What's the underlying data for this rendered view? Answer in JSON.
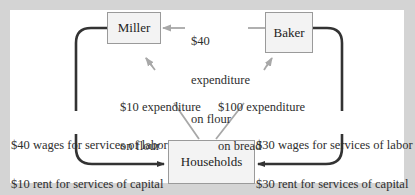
{
  "diagram": {
    "type": "circular-flow",
    "nodes": {
      "miller": {
        "label": "Miller"
      },
      "baker": {
        "label": "Baker"
      },
      "households": {
        "label": "Households"
      }
    },
    "flows": {
      "baker_to_miller": {
        "line1": "$40",
        "line2": "expenditure",
        "line3": "on flour"
      },
      "households_to_miller": {
        "line1": "$10 expenditure",
        "line2": "on flour"
      },
      "households_to_baker": {
        "line1": "$100 expenditure",
        "line2": "on bread"
      },
      "miller_to_households": {
        "line1": "$40 wages for services of labor",
        "line2": "$10 rent for services of capital"
      },
      "baker_to_households": {
        "line1": "$30 wages for services of labor",
        "line2": "$30 rent for services of capital"
      }
    },
    "colors": {
      "background": "#d4d4d4",
      "panel": "#ffffff",
      "box_fill": "#f3f3f3",
      "box_border": "#9a9a9a",
      "income_arrow": "#333333",
      "expenditure_arrow": "#a8a8a8"
    }
  }
}
